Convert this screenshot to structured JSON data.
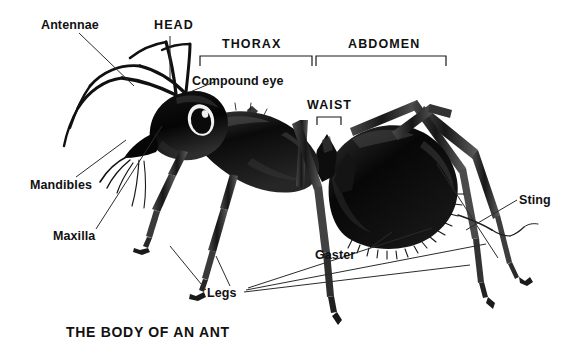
{
  "figure": {
    "title": "THE BODY OF AN ANT",
    "background_color": "#ffffff",
    "ink_color": "#111111",
    "leader_line_color": "#333333"
  },
  "labels": {
    "antennae": "Antennae",
    "head": "HEAD",
    "thorax": "THORAX",
    "abdomen": "ABDOMEN",
    "compound_eye": "Compound eye",
    "waist": "WAIST",
    "mandibles": "Mandibles",
    "maxilla": "Maxilla",
    "sting": "Sting",
    "gaster": "Gaster",
    "legs": "Legs"
  },
  "brackets": [
    {
      "name": "thorax",
      "label": "THORAX",
      "x1": 200,
      "x2": 312,
      "y": 56,
      "tick": 10
    },
    {
      "name": "abdomen",
      "label": "ABDOMEN",
      "x1": 316,
      "x2": 446,
      "y": 56,
      "tick": 10
    },
    {
      "name": "waist",
      "label": "WAIST",
      "x1": 317,
      "x2": 341,
      "y": 117,
      "tick": 8
    }
  ]
}
